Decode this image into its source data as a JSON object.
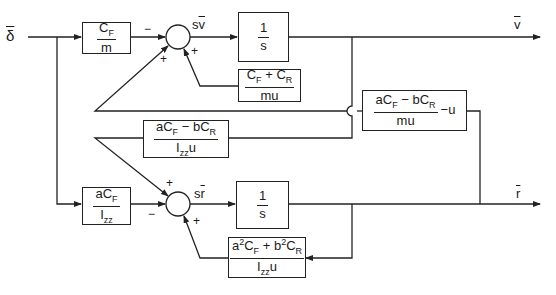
{
  "diagram": {
    "type": "block-diagram",
    "title": "",
    "input": {
      "label": "δ",
      "overbar": true
    },
    "outputs": [
      {
        "id": "v",
        "label": "v",
        "overbar": true
      },
      {
        "id": "r",
        "label": "r",
        "overbar": true
      }
    ],
    "blocks": {
      "cf_over_m": {
        "num": "C_F",
        "den": "m"
      },
      "integrator_v": {
        "num": "1",
        "den": "s"
      },
      "cf_plus_cr_over_mu": {
        "num": "C_F + C_R",
        "den": "mu"
      },
      "cross_v_to_r_term": {
        "num": "aC_F − bC_R",
        "den": "mu",
        "suffix": "−u"
      },
      "cross_r_to_v_term": {
        "num": "aC_F − bC_R",
        "den": "I_zz u"
      },
      "acf_over_izz": {
        "num": "aC_F",
        "den": "I_zz"
      },
      "integrator_r": {
        "num": "1",
        "den": "s"
      },
      "a2cf_b2cr_over_izzu": {
        "num": "a²C_F + b²C_R",
        "den": "I_zz u"
      }
    },
    "summing_junctions": [
      {
        "id": "sum_v",
        "output_label": "sv̄",
        "signs": {
          "left": "−",
          "lower_left": "+",
          "bottom": "+"
        }
      },
      {
        "id": "sum_r",
        "output_label": "sr̄",
        "signs": {
          "left": "−",
          "upper_left": "+",
          "bottom": "+"
        }
      }
    ],
    "labels": {
      "delta": "δ",
      "v_out": "v",
      "r_out": "r",
      "sv": "sv",
      "sr": "sr",
      "minus": "−",
      "plus": "+"
    },
    "text": {
      "cf_num_C": "C",
      "cf_num_F": "F",
      "cf_den": "m",
      "int_num": "1",
      "int_den": "s",
      "cfcr_C1": "C",
      "cfcr_F": "F",
      "cfcr_plus": " + C",
      "cfcr_R": "R",
      "cfcr_den": "mu",
      "x1_a": "aC",
      "x1_F": "F",
      "x1_mid": " − bC",
      "x1_R": "R",
      "x1_den": "mu",
      "x1_suffix": "−u",
      "x2_a": "aC",
      "x2_F": "F",
      "x2_mid": " − bC",
      "x2_R": "R",
      "x2_den_I": "I",
      "x2_den_zz": "zz",
      "x2_den_u": "u",
      "ai_a": "aC",
      "ai_F": "F",
      "ai_I": "I",
      "ai_zz": "zz",
      "ab_a": "a",
      "ab_2a": "2",
      "ab_C": "C",
      "ab_F": "F",
      "ab_plus": " + b",
      "ab_2b": "2",
      "ab_C2": "C",
      "ab_R": "R",
      "ab_den_I": "I",
      "ab_den_zz": "zz",
      "ab_den_u": "u"
    },
    "colors": {
      "line": "#222222",
      "background": "#ffffff"
    }
  }
}
